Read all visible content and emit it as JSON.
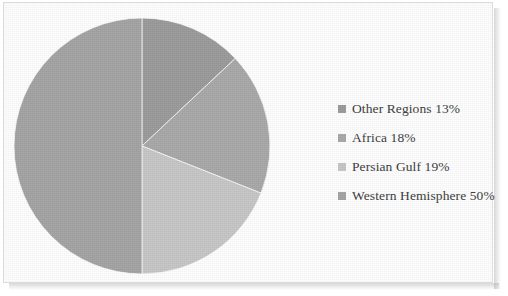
{
  "chart_data": {
    "type": "pie",
    "title": "",
    "categories": [
      "Other Regions",
      "Africa",
      "Persian Gulf",
      "Western Hemisphere"
    ],
    "values": [
      13,
      18,
      19,
      50
    ],
    "value_unit": "%",
    "legend_position": "right",
    "grid": false,
    "start_angle_deg": 0,
    "direction": "clockwise",
    "slices": [
      {
        "label": "Other Regions",
        "value": 13,
        "legend_text": "Other Regions 13%",
        "color": "#9a9a9a",
        "start_angle_deg": 0,
        "end_angle_deg": 46.8
      },
      {
        "label": "Africa",
        "value": 18,
        "legend_text": "Africa 18%",
        "color": "#a8a8a8",
        "start_angle_deg": 46.8,
        "end_angle_deg": 111.6
      },
      {
        "label": "Persian Gulf",
        "value": 19,
        "legend_text": "Persian Gulf 19%",
        "color": "#c6c6c6",
        "start_angle_deg": 111.6,
        "end_angle_deg": 180.0
      },
      {
        "label": "Western Hemisphere",
        "value": 50,
        "legend_text": "Western Hemisphere 50%",
        "color": "#a3a3a3",
        "start_angle_deg": 180.0,
        "end_angle_deg": 360.0
      }
    ]
  },
  "legend": {
    "items": [
      {
        "label": "Other Regions 13%",
        "color": "#9a9a9a",
        "swatch_name": "legend-swatch-other-regions"
      },
      {
        "label": "Africa 18%",
        "color": "#a8a8a8",
        "swatch_name": "legend-swatch-africa"
      },
      {
        "label": "Persian Gulf 19%",
        "color": "#c6c6c6",
        "swatch_name": "legend-swatch-persian-gulf"
      },
      {
        "label": "Western Hemisphere 50%",
        "color": "#a3a3a3",
        "swatch_name": "legend-swatch-western-hemisphere"
      }
    ]
  },
  "frame": {
    "border_color": "#dcdcdc",
    "background": "#fefefe"
  }
}
